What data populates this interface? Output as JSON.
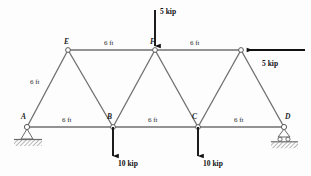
{
  "figure": {
    "units": "ft",
    "force_units": "kip",
    "background_color": "#fdfdfd",
    "member_color": "#6b6b6b",
    "load_color": "#111111",
    "ground_color": "#8a8a8a"
  },
  "nodes": [
    {
      "id": "A",
      "label": "A",
      "x": 27,
      "y": 127,
      "support": "pin"
    },
    {
      "id": "B",
      "label": "B",
      "x": 113,
      "y": 127,
      "support": "none"
    },
    {
      "id": "C",
      "label": "C",
      "x": 198,
      "y": 127,
      "support": "none"
    },
    {
      "id": "D",
      "label": "D",
      "x": 284,
      "y": 127,
      "support": "roller"
    },
    {
      "id": "E",
      "label": "E",
      "x": 68,
      "y": 50,
      "support": "none"
    },
    {
      "id": "F",
      "label": "F",
      "x": 155,
      "y": 50,
      "support": "none"
    },
    {
      "id": "G",
      "label": "",
      "x": 241,
      "y": 50,
      "support": "none"
    }
  ],
  "members": [
    {
      "from": "A",
      "to": "B"
    },
    {
      "from": "B",
      "to": "C"
    },
    {
      "from": "C",
      "to": "D"
    },
    {
      "from": "E",
      "to": "F"
    },
    {
      "from": "F",
      "to": "G"
    },
    {
      "from": "A",
      "to": "E"
    },
    {
      "from": "E",
      "to": "B"
    },
    {
      "from": "B",
      "to": "F"
    },
    {
      "from": "F",
      "to": "C"
    },
    {
      "from": "C",
      "to": "G"
    },
    {
      "from": "G",
      "to": "D"
    }
  ],
  "dimensions": [
    {
      "id": "top-left",
      "text": "6 ft",
      "x": 104,
      "y": 40
    },
    {
      "id": "top-right",
      "text": "6 ft",
      "x": 190,
      "y": 40
    },
    {
      "id": "left-diag",
      "text": "6 ft",
      "x": 30,
      "y": 79
    },
    {
      "id": "bottom-ab",
      "text": "6 ft",
      "x": 62,
      "y": 117
    },
    {
      "id": "bottom-bc",
      "text": "6 ft",
      "x": 148,
      "y": 117
    },
    {
      "id": "bottom-cd",
      "text": "6 ft",
      "x": 234,
      "y": 117
    }
  ],
  "loads": [
    {
      "id": "load-top-F",
      "text": "5 kip",
      "magnitude": 5,
      "direction": "down",
      "at_node": "F",
      "label_x": 160,
      "label_y": 8
    },
    {
      "id": "load-right-G",
      "text": "5 kip",
      "magnitude": 5,
      "direction": "left",
      "at_node": "G",
      "label_x": 262,
      "label_y": 60
    },
    {
      "id": "load-B",
      "text": "10 kip",
      "magnitude": 10,
      "direction": "down",
      "at_node": "B",
      "label_x": 118,
      "label_y": 160
    },
    {
      "id": "load-C",
      "text": "10 kip",
      "magnitude": 10,
      "direction": "down",
      "at_node": "C",
      "label_x": 203,
      "label_y": 160
    }
  ]
}
